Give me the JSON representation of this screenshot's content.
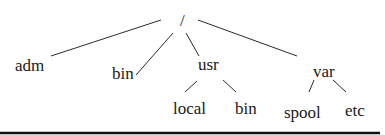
{
  "diagram": {
    "type": "tree",
    "root": {
      "id": "root",
      "label": "/",
      "x": 184,
      "y": 20
    },
    "nodes": [
      {
        "id": "adm",
        "label": "adm",
        "x": 30,
        "y": 70,
        "parent": "root"
      },
      {
        "id": "bin",
        "label": "bin",
        "x": 123,
        "y": 78,
        "parent": "root"
      },
      {
        "id": "usr",
        "label": "usr",
        "x": 215,
        "y": 68,
        "parent": "root"
      },
      {
        "id": "var",
        "label": "var",
        "x": 328,
        "y": 77,
        "parent": "root"
      },
      {
        "id": "local",
        "label": "local",
        "x": 188,
        "y": 112,
        "parent": "usr"
      },
      {
        "id": "usrbin",
        "label": "bin",
        "x": 249,
        "y": 112,
        "parent": "usr"
      },
      {
        "id": "spool",
        "label": "spool",
        "x": 284,
        "y": 116,
        "parent": "var"
      },
      {
        "id": "etc",
        "label": "etc",
        "x": 345,
        "y": 114,
        "parent": "var"
      }
    ]
  }
}
